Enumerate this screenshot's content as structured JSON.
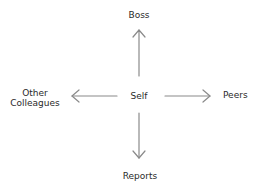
{
  "diagram": {
    "center": {
      "label": "Self"
    },
    "nodes": {
      "top": {
        "label": "Boss"
      },
      "right": {
        "label": "Peers"
      },
      "bottom": {
        "label": "Reports"
      },
      "left": {
        "label_line1": "Other",
        "label_line2": "Colleagues"
      }
    },
    "arrow_color": "#8a8a8a",
    "text_color": "#2a2a2a"
  }
}
